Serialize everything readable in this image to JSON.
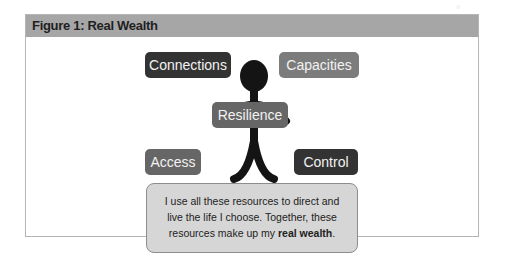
{
  "figure": {
    "title": "Figure 1: Real Wealth",
    "center_label": "Resilience",
    "boxes": {
      "top_left": "Connections",
      "top_right": "Capacities",
      "bottom_left": "Access",
      "bottom_right": "Control"
    },
    "note": {
      "line1": "I use all these resources to direct and",
      "line2": "live the life I choose. Together, these",
      "line3_prefix": "resources make up my ",
      "line3_bold": "real wealth",
      "line3_suffix": "."
    },
    "colors": {
      "header": "#a6a6a6",
      "dark_box": "#333333",
      "grey_box": "#7c7c7c",
      "center_box": "#666666",
      "note_bg": "#d6d6d6"
    }
  }
}
